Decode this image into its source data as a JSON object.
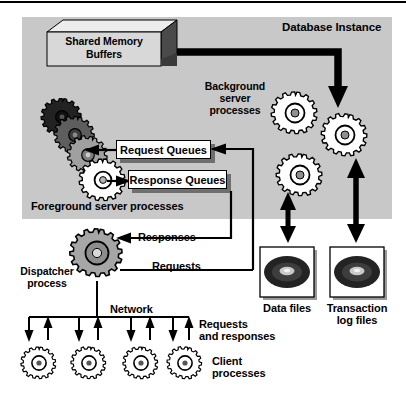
{
  "diagram": {
    "title": "Database Instance",
    "type": "architecture-diagram",
    "background_color": "#ffffff",
    "panel_color": "#c8c8c8",
    "line_color": "#000000"
  },
  "instance_panel": {
    "title": "Database Instance",
    "shared_memory": {
      "line1": "Shared Memory",
      "line2": "Buffers"
    },
    "background_processes_label": "Background\nserver\nprocesses",
    "foreground_processes_label": "Foreground server processes",
    "request_queues_label": "Request Queues",
    "response_queues_label": "Response Queues"
  },
  "dispatcher": {
    "label": "Dispatcher\nprocess",
    "responses_label": "Responses",
    "requests_label": "Requests"
  },
  "network": {
    "label": "Network",
    "traffic_label": "Requests\nand responses"
  },
  "clients": {
    "label": "Client\nprocesses",
    "count": 4
  },
  "storage": {
    "data_files_label": "Data files",
    "transaction_log_label": "Transaction\nlog files"
  },
  "gears": {
    "foreground_colors": [
      "#2b2b2b",
      "#5a5a5a",
      "#9a9a9a",
      "#ffffff"
    ],
    "background_color": "#ffffff",
    "dispatcher_color": "#a8a8a8",
    "client_color": "#ffffff"
  }
}
